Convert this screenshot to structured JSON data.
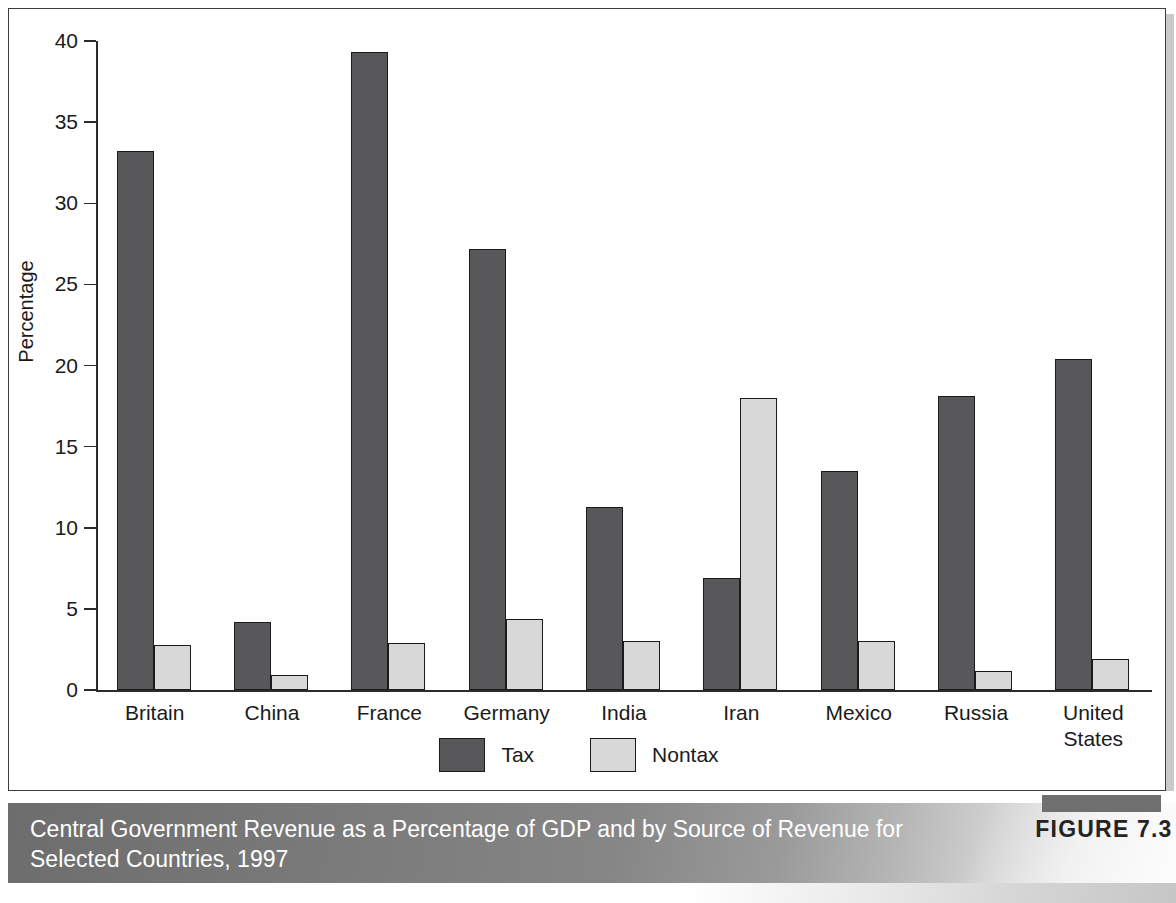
{
  "figure": {
    "badge_label": "FIGURE 7.3",
    "caption": "Central Government Revenue as a Percentage of GDP and by Source of Revenue for Selected Countries, 1997"
  },
  "colors": {
    "tax": "#58585a",
    "nontax": "#d8d8d8",
    "bar_outline": "#1b1b1b",
    "axis": "#2b2b2b",
    "caption_text": "#ffffff",
    "badge_text": "#242424"
  },
  "chart_data": {
    "type": "bar",
    "title": "",
    "xlabel": "",
    "ylabel": "Percentage",
    "ylim": [
      0,
      40
    ],
    "yticks": [
      0,
      5,
      10,
      15,
      20,
      25,
      30,
      35,
      40
    ],
    "ytick_labels": [
      "0",
      "5",
      "10",
      "15",
      "20",
      "25",
      "30",
      "35",
      "40"
    ],
    "grid": false,
    "legend_position": "bottom-center",
    "categories": [
      "Britain",
      "China",
      "France",
      "Germany",
      "India",
      "Iran",
      "Mexico",
      "Russia",
      "United States"
    ],
    "series": [
      {
        "name": "Tax",
        "color": "#58585a",
        "values": [
          33.2,
          4.2,
          39.3,
          27.2,
          11.3,
          6.9,
          13.5,
          18.1,
          20.4
        ]
      },
      {
        "name": "Nontax",
        "color": "#d8d8d8",
        "values": [
          2.8,
          0.9,
          2.9,
          4.4,
          3.0,
          18.0,
          3.0,
          1.2,
          1.9
        ]
      }
    ]
  }
}
